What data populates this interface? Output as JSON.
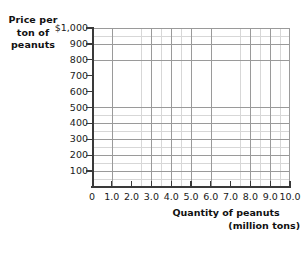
{
  "chart_data": {
    "type": "line",
    "title": "",
    "subtitle": "",
    "series": [],
    "data_points": [],
    "grid": true,
    "legend": null,
    "xlabel": "Quantity of peanuts",
    "xlabel_line2": "(million tons)",
    "ylabel": "Price per ton of peanuts",
    "ylabel_lines": [
      "Price per",
      "ton of",
      "peanuts"
    ],
    "xlim": [
      0,
      10.0
    ],
    "ylim": [
      0,
      1000
    ],
    "x_tick_values": [
      0,
      1.0,
      2.0,
      3.0,
      4.0,
      5.0,
      6.0,
      7.0,
      8.0,
      9.0,
      10.0
    ],
    "x_tick_labels": [
      "0",
      "1.0",
      "2.0",
      "3.0",
      "4.0",
      "5.0",
      "6.0",
      "7.0",
      "8.0",
      "9.0",
      "10.0"
    ],
    "y_tick_values": [
      100,
      200,
      300,
      400,
      500,
      600,
      700,
      800,
      900,
      1000
    ],
    "y_tick_labels": [
      "100",
      "200",
      "300",
      "400",
      "500",
      "600",
      "700",
      "800",
      "900",
      "$1,000"
    ],
    "x_major_step": 1.0,
    "y_major_step": 100,
    "minor_per_major_x": 2,
    "minor_per_major_y": 2,
    "colors": {
      "background": "#ffffff",
      "axis": "#3a3a3a",
      "grid_major": "#9a9a9a",
      "grid_minor": "#d7d7d7",
      "text": "#1a1a1a",
      "title_text": "#111111"
    }
  },
  "axes": {
    "y_title": {
      "line1": "Price per",
      "line2": "ton of",
      "line3": "peanuts"
    },
    "x_title": {
      "line1": "Quantity of peanuts",
      "line2": "(million tons)"
    },
    "y_labels": [
      {
        "text": "$1,000",
        "value": 1000
      },
      {
        "text": "900",
        "value": 900
      },
      {
        "text": "800",
        "value": 800
      },
      {
        "text": "700",
        "value": 700
      },
      {
        "text": "600",
        "value": 600
      },
      {
        "text": "500",
        "value": 500
      },
      {
        "text": "400",
        "value": 400
      },
      {
        "text": "300",
        "value": 300
      },
      {
        "text": "200",
        "value": 200
      },
      {
        "text": "100",
        "value": 100
      }
    ],
    "x_labels": [
      {
        "text": "0",
        "value": 0
      },
      {
        "text": "1.0",
        "value": 1.0
      },
      {
        "text": "2.0",
        "value": 2.0
      },
      {
        "text": "3.0",
        "value": 3.0
      },
      {
        "text": "4.0",
        "value": 4.0
      },
      {
        "text": "5.0",
        "value": 5.0
      },
      {
        "text": "6.0",
        "value": 6.0
      },
      {
        "text": "7.0",
        "value": 7.0
      },
      {
        "text": "8.0",
        "value": 8.0
      },
      {
        "text": "9.0",
        "value": 9.0
      },
      {
        "text": "10.0",
        "value": 10.0
      }
    ]
  }
}
